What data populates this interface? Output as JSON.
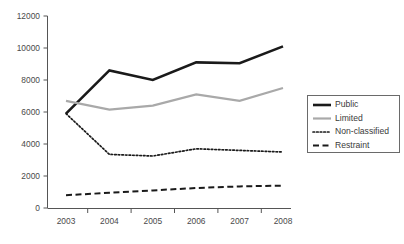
{
  "chart_data": {
    "type": "line",
    "title": "",
    "xlabel": "",
    "ylabel": "",
    "categories": [
      "2003",
      "2004",
      "2005",
      "2006",
      "2007",
      "2008"
    ],
    "x": [
      2003,
      2004,
      2005,
      2006,
      2007,
      2008
    ],
    "ylim": [
      0,
      12000
    ],
    "yticks": [
      0,
      2000,
      4000,
      6000,
      8000,
      10000,
      12000
    ],
    "ytick_labels": [
      "0",
      "2000",
      "4000",
      "6000",
      "8000",
      "10000",
      "12000"
    ],
    "xtick_labels": [
      "2003",
      "2004",
      "2005",
      "2006",
      "2007",
      "2008"
    ],
    "grid": false,
    "legend_position": "right",
    "series": [
      {
        "name": "Public",
        "values": [
          5900,
          8600,
          8000,
          9100,
          9050,
          10100
        ],
        "color": "#1a1a1a",
        "style": "solid",
        "width": 2.6,
        "dash": "none"
      },
      {
        "name": "Limited",
        "values": [
          6700,
          6150,
          6400,
          7100,
          6700,
          7500
        ],
        "color": "#a9a9a9",
        "style": "solid",
        "width": 2.2,
        "dash": "none"
      },
      {
        "name": "Non-classified",
        "values": [
          5900,
          3350,
          3250,
          3700,
          3600,
          3500
        ],
        "color": "#1a1a1a",
        "style": "dotted",
        "width": 1.7,
        "dash": "1.6,2.0"
      },
      {
        "name": "Restraint",
        "values": [
          800,
          950,
          1100,
          1250,
          1350,
          1400
        ],
        "color": "#1a1a1a",
        "style": "dashed",
        "width": 2.0,
        "dash": "6,3.5"
      }
    ]
  },
  "legend": {
    "entries": [
      {
        "label": "Public"
      },
      {
        "label": "Limited"
      },
      {
        "label": "Non-classified"
      },
      {
        "label": "Restraint"
      }
    ]
  }
}
